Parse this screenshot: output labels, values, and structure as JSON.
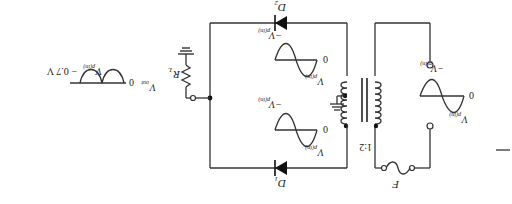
{
  "diagram": {
    "orientation": "rotated 180 degrees",
    "components": {
      "fuse": {
        "label": "F"
      },
      "transformer": {
        "ratio": "1:2"
      },
      "diode1": {
        "label": "D",
        "sub": "1"
      },
      "diode2": {
        "label": "D",
        "sub": "2"
      },
      "load": {
        "label": "R",
        "sub": "L"
      }
    },
    "input_wave": {
      "pos": "V",
      "pos_sub": "p(in)",
      "neg": "−V",
      "neg_sub": "p(in)",
      "zero": "0"
    },
    "secondary_wave_top": {
      "pos": "V",
      "pos_sub": "p(in)",
      "neg": "−V",
      "neg_sub": "p(in)",
      "zero": "0"
    },
    "secondary_wave_bottom": {
      "pos": "V",
      "pos_sub": "p(in)",
      "neg": "−V",
      "neg_sub": "p(in)",
      "zero": "0"
    },
    "output_wave": {
      "label": "V",
      "label_sub": "out",
      "zero": "0",
      "peak": "V",
      "peak_sub": "p(in)",
      "peak_suffix": " − 0.7 V"
    }
  }
}
